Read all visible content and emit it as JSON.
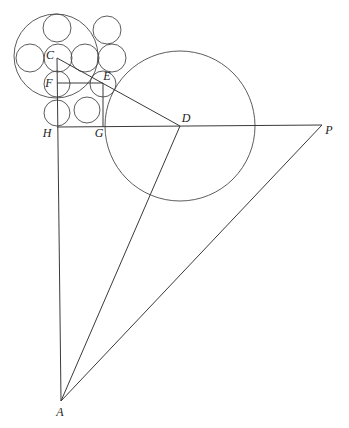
{
  "diagram": {
    "type": "geometric-construction",
    "points": {
      "A": {
        "label": "A",
        "x": 61,
        "y": 401,
        "lx": 60,
        "ly": 416
      },
      "C": {
        "label": "C",
        "x": 57,
        "y": 58,
        "lx": 50,
        "ly": 59
      },
      "D": {
        "label": "D",
        "x": 180,
        "y": 126,
        "lx": 186,
        "ly": 122
      },
      "E": {
        "label": "E",
        "x": 103,
        "y": 83,
        "lx": 107,
        "ly": 80
      },
      "F": {
        "label": "F",
        "x": 57,
        "y": 83,
        "lx": 49,
        "ly": 87
      },
      "G": {
        "label": "G",
        "x": 103,
        "y": 127,
        "lx": 99,
        "ly": 137
      },
      "H": {
        "label": "H",
        "x": 57,
        "y": 127,
        "lx": 47,
        "ly": 137
      },
      "P": {
        "label": "P",
        "x": 322,
        "y": 125,
        "lx": 329,
        "ly": 134
      }
    },
    "large_circles": [
      {
        "name": "outer-circle-C",
        "cx": 56,
        "cy": 56,
        "r": 42
      },
      {
        "name": "circle-D",
        "cx": 180,
        "cy": 126,
        "r": 75
      }
    ],
    "small_circles": [
      {
        "cx": 57,
        "cy": 28,
        "r": 14
      },
      {
        "cx": 107,
        "cy": 30,
        "r": 14
      },
      {
        "cx": 30,
        "cy": 58,
        "r": 14
      },
      {
        "cx": 58,
        "cy": 58,
        "r": 14
      },
      {
        "cx": 85,
        "cy": 58,
        "r": 14
      },
      {
        "cx": 112,
        "cy": 58,
        "r": 14
      },
      {
        "cx": 57,
        "cy": 84,
        "r": 13
      },
      {
        "cx": 103,
        "cy": 84,
        "r": 13
      },
      {
        "cx": 87,
        "cy": 110,
        "r": 13
      },
      {
        "cx": 57,
        "cy": 113,
        "r": 13
      }
    ],
    "segments": [
      [
        "C",
        "D"
      ],
      [
        "C",
        "A"
      ],
      [
        "D",
        "A"
      ],
      [
        "H",
        "P"
      ],
      [
        "P",
        "A"
      ],
      [
        "F",
        "E"
      ],
      [
        "E",
        "G"
      ]
    ]
  }
}
